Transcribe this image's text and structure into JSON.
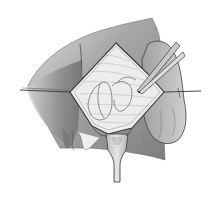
{
  "figure": {
    "type": "surgical-illustration",
    "style": "grayscale pencil drawing",
    "caption": ""
  },
  "colors": {
    "background": "#ffffff",
    "outline": "#3a3a3a",
    "skin_dark": "#8a8a8a",
    "skin_mid": "#b0b0b0",
    "skin_light": "#d2d2d2",
    "incision_bed": "#efefef",
    "instrument": "#c8c8c8"
  }
}
